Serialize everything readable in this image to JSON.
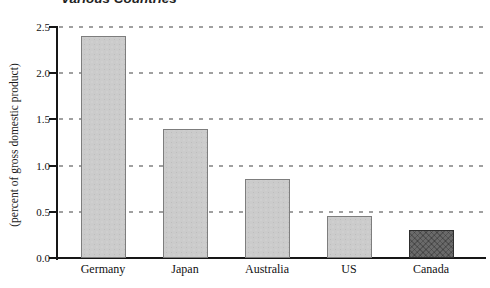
{
  "title": "Various Countries",
  "chart_data": {
    "type": "bar",
    "title": "Various Countries",
    "title_note": "title is clipped at the top edge of the image; only its lower half is visible",
    "categories": [
      "Germany",
      "Japan",
      "Australia",
      "US",
      "Canada"
    ],
    "values": [
      2.4,
      1.4,
      0.85,
      0.45,
      0.3
    ],
    "xlabel": "",
    "ylabel": "(percent of gross domestic product)",
    "ylim": [
      0,
      2.5
    ],
    "yticks": [
      0.0,
      0.5,
      1.0,
      1.5,
      2.0,
      2.5
    ],
    "ytick_labels": [
      "0.0",
      "0.5",
      "1.0",
      "1.5",
      "2.0",
      "2.5"
    ],
    "grid": "dashed horizontal gridlines at each y tick above zero",
    "legend": "none",
    "highlighted_category": "Canada",
    "colors": {
      "background": "#ffffff",
      "bar_light_fill": "#cbcbcb",
      "bar_light_border": "#7d7d7d",
      "bar_dark_fill": "#6a6a6a",
      "bar_dark_border": "#2e2e2e",
      "axis": "#161616",
      "gridline": "#a0a0a0",
      "text": "#111111"
    }
  }
}
